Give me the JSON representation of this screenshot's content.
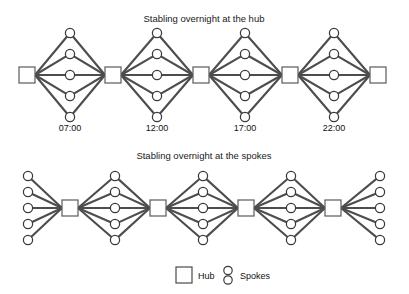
{
  "figure": {
    "width": 409,
    "height": 294,
    "background": "#ffffff",
    "line_color": "#4d4d4d",
    "node_stroke": "#3a3a3a",
    "node_fill": "#ffffff"
  },
  "panels": [
    {
      "id": "hub-stabling",
      "title": "Stabling overnight at the hub",
      "title_x": 204,
      "title_y": 22,
      "axis_y": 75,
      "pattern": "hub-ends",
      "hub_xs": [
        27,
        113,
        201,
        290,
        378
      ],
      "spoke_column_xs": [
        70,
        157,
        245,
        334
      ],
      "spoke_ys": [
        33,
        54,
        75,
        96,
        117
      ],
      "time_labels": [
        {
          "text": "07:00",
          "x": 70,
          "y": 131
        },
        {
          "text": "12:00",
          "x": 157,
          "y": 131
        },
        {
          "text": "17:00",
          "x": 245,
          "y": 131
        },
        {
          "text": "22:00",
          "x": 334,
          "y": 131
        }
      ]
    },
    {
      "id": "spokes-stabling",
      "title": "Stabling overnight at the spokes",
      "title_x": 204,
      "title_y": 159,
      "axis_y": 208,
      "pattern": "spoke-ends",
      "hub_xs": [
        70,
        158,
        246,
        333
      ],
      "spoke_column_xs": [
        28,
        115,
        203,
        291,
        380
      ],
      "spoke_ys": [
        176,
        192,
        208,
        224,
        240
      ],
      "time_labels": []
    }
  ],
  "legend": {
    "hub": {
      "label": "Hub",
      "swatch_x": 176,
      "swatch_y": 267,
      "swatch_size": 16,
      "label_x": 198,
      "label_y": 278
    },
    "spokes": {
      "label": "Spokes",
      "circle_x": 228,
      "circle_y_top": 270,
      "circle_y_bottom": 280,
      "radius": 4.2,
      "label_x": 240,
      "label_y": 278
    }
  },
  "node_geometry": {
    "hub_size": 16,
    "spoke_radius": 4.6
  }
}
